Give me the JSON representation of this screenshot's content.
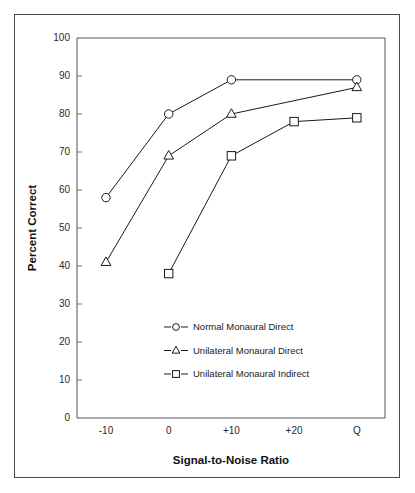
{
  "chart_data": {
    "type": "line",
    "title": "",
    "xlabel": "Signal-to-Noise Ratio",
    "ylabel": "Percent Correct",
    "categories": [
      "-10",
      "0",
      "+10",
      "+20",
      "Q"
    ],
    "x_tick_labels": [
      "-10",
      "0",
      "+10",
      "+20",
      "Q"
    ],
    "y_tick_labels": [
      "0",
      "10",
      "20",
      "30",
      "40",
      "50",
      "60",
      "70",
      "80",
      "90",
      "100"
    ],
    "y_ticks": [
      0,
      10,
      20,
      30,
      40,
      50,
      60,
      70,
      80,
      90,
      100
    ],
    "ylim": [
      0,
      100
    ],
    "grid": false,
    "legend_position": "center",
    "series": [
      {
        "name": "Normal Monaural Direct",
        "marker": "circle",
        "color": "#1a1a1a",
        "x": [
          "-10",
          "0",
          "+10",
          "+20",
          "Q"
        ],
        "values": [
          58,
          80,
          89,
          null,
          89
        ]
      },
      {
        "name": "Unilateral Monaural Direct",
        "marker": "triangle",
        "color": "#1a1a1a",
        "x": [
          "-10",
          "0",
          "+10",
          "+20",
          "Q"
        ],
        "values": [
          41,
          69,
          80,
          null,
          87
        ]
      },
      {
        "name": "Unilateral Monaural Indirect",
        "marker": "square",
        "color": "#1a1a1a",
        "x": [
          "-10",
          "0",
          "+10",
          "+20",
          "Q"
        ],
        "values": [
          null,
          38,
          69,
          78,
          79
        ]
      }
    ]
  },
  "legend": {
    "entries": [
      {
        "label": "Normal Monaural Direct",
        "marker": "circle"
      },
      {
        "label": "Unilateral Monaural Direct",
        "marker": "triangle"
      },
      {
        "label": "Unilateral Monaural Indirect",
        "marker": "square"
      }
    ]
  },
  "colors": {
    "frame": "#4a4a4a",
    "axis": "#555555",
    "ink": "#1a1a1a",
    "background": "#ffffff"
  }
}
